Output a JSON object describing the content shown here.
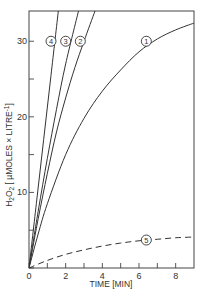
{
  "chart_data": {
    "type": "line",
    "title": "",
    "xlabel": "TIME [MIN]",
    "ylabel": "H2O2 [µMOLES × LITRE⁻¹]",
    "xlim": [
      0,
      9
    ],
    "ylim": [
      0,
      34
    ],
    "x_ticks": [
      0,
      2,
      4,
      6,
      8
    ],
    "x_minor_ticks": [
      1,
      3,
      5,
      7
    ],
    "y_ticks": [
      0,
      10,
      20,
      30
    ],
    "y_minor_ticks": [
      5,
      15,
      25
    ],
    "grid": false,
    "legend": "inline circled numbers on curves",
    "series": [
      {
        "name": "1",
        "style": "solid",
        "label_at": [
          6.4,
          30
        ],
        "x": [
          0,
          0.5,
          1,
          2,
          3,
          4,
          5,
          6,
          7,
          8,
          9
        ],
        "y": [
          0,
          4.5,
          8.5,
          15.0,
          19.8,
          23.4,
          26.2,
          28.6,
          30.3,
          31.5,
          32.4
        ]
      },
      {
        "name": "2",
        "style": "solid",
        "label_at": [
          2.8,
          30
        ],
        "x": [
          0,
          0.5,
          1,
          1.5,
          2,
          2.5,
          3,
          3.6
        ],
        "y": [
          0,
          6.5,
          12.5,
          18.0,
          22.5,
          26.5,
          30.0,
          34
        ]
      },
      {
        "name": "3",
        "style": "solid",
        "label_at": [
          2.0,
          30
        ],
        "x": [
          0,
          0.5,
          1,
          1.5,
          2,
          2.7
        ],
        "y": [
          0,
          7.5,
          14.5,
          21.0,
          27.0,
          34
        ]
      },
      {
        "name": "4",
        "style": "solid",
        "label_at": [
          1.2,
          30
        ],
        "x": [
          0,
          0.4,
          0.8,
          1.2,
          1.6
        ],
        "y": [
          0,
          8.5,
          17.0,
          25.5,
          34
        ]
      },
      {
        "name": "5",
        "style": "dashed",
        "label_at": [
          6.4,
          3.7
        ],
        "x": [
          0,
          1,
          2,
          3,
          4,
          5,
          6,
          7,
          8,
          9
        ],
        "y": [
          0,
          1.0,
          1.8,
          2.4,
          2.9,
          3.3,
          3.6,
          3.8,
          4.0,
          4.1
        ]
      }
    ]
  },
  "axes": {
    "x_title": "TIME [MIN]",
    "y_title_main": "H",
    "y_title_sub1": "2",
    "y_title_mid": "O",
    "y_title_sub2": "2",
    "y_title_rest": " [ µMOLES × LITRE",
    "y_title_sup": "-1",
    "y_title_end": "]"
  }
}
